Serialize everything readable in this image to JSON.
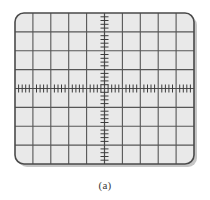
{
  "figure": {
    "caption": "(a)",
    "kind": "oscilloscope-graticule"
  },
  "scope": {
    "label": "oscilloscope-screen",
    "screen": {
      "x": 14,
      "y": 12,
      "width": 183,
      "height": 155,
      "corner_radius": 9,
      "fill_color": "#e9e9e9",
      "border_color": "#4a4a4a",
      "border_width": 1.6,
      "shadow_color": "#bdbdbd"
    },
    "graticule": {
      "horizontal_divisions": 10,
      "vertical_divisions": 8,
      "grid_color": "#565656",
      "grid_width": 1.1,
      "subdivisions_per_division": 5,
      "tick_color": "#3d3d3d",
      "tick_length": 4,
      "tick_width": 1.0,
      "center_axis_color": "#4a4a4a",
      "center_axis_width": 1.2
    },
    "trace": {
      "present": false,
      "description": "blank screen, no waveform displayed"
    }
  }
}
